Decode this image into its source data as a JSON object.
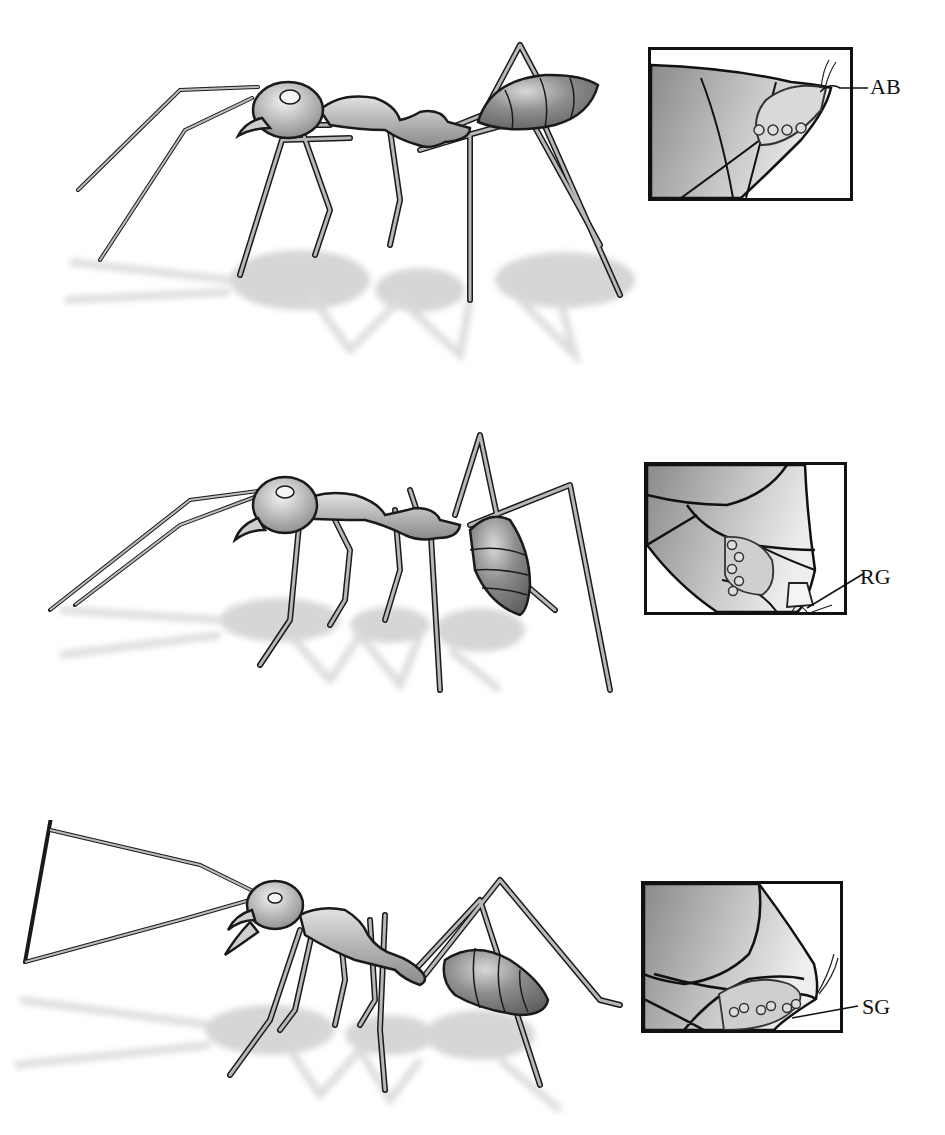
{
  "figure": {
    "panels": [
      {
        "id": "panel-1",
        "subject": "ant in side view, gaster raised with tip pointing backward",
        "inset": {
          "label": "AB",
          "depicts": "gaster tip with gland openings and bristles"
        }
      },
      {
        "id": "panel-2",
        "subject": "ant in side view, gaster curled downward",
        "inset": {
          "label": "RG",
          "depicts": "gaster tip showing gland under terminal segment"
        }
      },
      {
        "id": "panel-3",
        "subject": "ant in side view, head raised, mandibles open, gaster lowered",
        "inset": {
          "label": "SG",
          "depicts": "gaster underside with gland openings and bristles"
        }
      }
    ],
    "colors": {
      "body_light": "#c9c9c9",
      "body_dark": "#7a7a7a",
      "outline": "#1a1a1a",
      "shadow": "#d4d4d4",
      "inset_dark": "#8c8c8c",
      "inset_light": "#e6e6e6"
    }
  }
}
